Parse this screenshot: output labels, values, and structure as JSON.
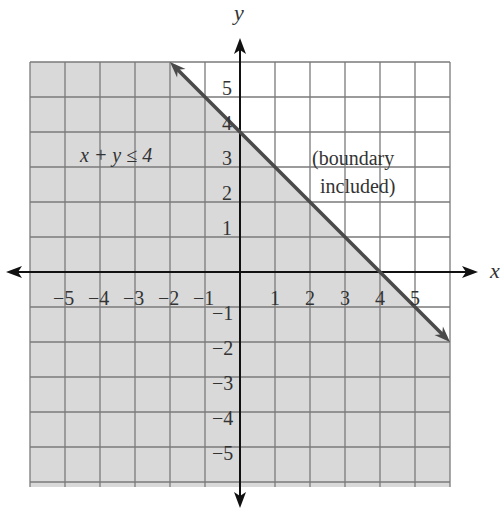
{
  "chart_data": {
    "type": "line",
    "title": "",
    "xlabel": "x",
    "ylabel": "y",
    "xlim": [
      -6,
      6
    ],
    "ylim": [
      -6,
      6
    ],
    "grid": true,
    "x_ticks": [
      "-5",
      "-4",
      "-3",
      "-2",
      "-1",
      "1",
      "2",
      "3",
      "4",
      "5"
    ],
    "y_ticks": [
      "5",
      "4",
      "3",
      "2",
      "1",
      "-1",
      "-2",
      "-3",
      "-4",
      "-5"
    ],
    "series": [
      {
        "name": "x + y = 4",
        "kind": "boundary-line",
        "style": "solid",
        "points": [
          [
            -2,
            6
          ],
          [
            6,
            -2
          ]
        ],
        "arrows": "both"
      }
    ],
    "shaded_region": {
      "inequality": "x + y ≤ 4",
      "side": "below-left",
      "color": "#d9d9d9"
    },
    "annotations": [
      {
        "text": "x + y ≤ 4",
        "x": -3.5,
        "y": 3.4
      },
      {
        "text": "(boundary",
        "x": 3.6,
        "y": 3.3
      },
      {
        "text": "included)",
        "x": 3.6,
        "y": 2.4
      }
    ]
  },
  "labels": {
    "x_axis": "x",
    "y_axis": "y",
    "inequality": "x + y ≤ 4",
    "note_line1": "(boundary",
    "note_line2": "included)"
  },
  "colors": {
    "shade": "#d9d9d9",
    "grid": "#7a7a7a",
    "axis": "#111111",
    "boundary": "#4a4a4a",
    "text": "#333333"
  }
}
